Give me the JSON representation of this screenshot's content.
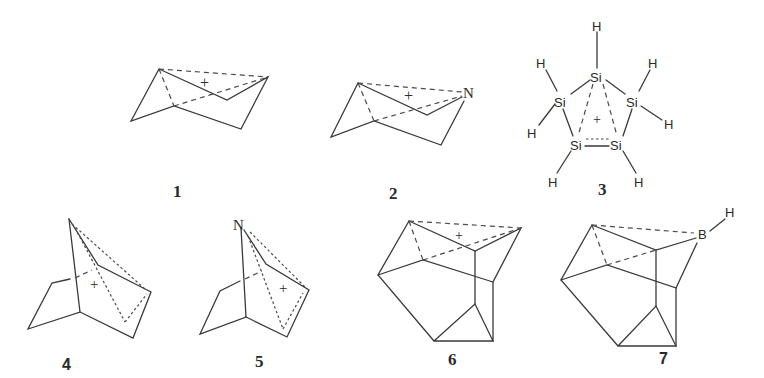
{
  "figure": {
    "type": "chemical-structures",
    "structures": [
      {
        "id": "1",
        "label": "1",
        "charge": "+",
        "atoms": []
      },
      {
        "id": "2",
        "label": "2",
        "charge": "+",
        "atoms": [
          "N"
        ]
      },
      {
        "id": "3",
        "label": "3",
        "charge": "+",
        "atoms": [
          "Si",
          "Si",
          "Si",
          "Si",
          "Si"
        ],
        "hydrogens": [
          "H",
          "H",
          "H",
          "H",
          "H",
          "H",
          "H"
        ]
      },
      {
        "id": "4",
        "label": "4",
        "charge": "+",
        "atoms": []
      },
      {
        "id": "5",
        "label": "5",
        "charge": "+",
        "atoms": [
          "N"
        ]
      },
      {
        "id": "6",
        "label": "6",
        "charge": "+",
        "atoms": []
      },
      {
        "id": "7",
        "label": "7",
        "charge": "",
        "atoms": [
          "B",
          "H"
        ]
      }
    ]
  }
}
